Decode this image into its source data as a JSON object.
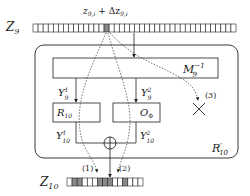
{
  "diagram": {
    "top_register": {
      "label": "Z",
      "label_sub": "9",
      "cell_count": 40,
      "highlighted_cells": [
        14
      ],
      "highlight_label": "z",
      "highlight_label_sub": "9,i",
      "highlight_label_op": " + Δz",
      "highlight_label_sub2": "9,i"
    },
    "outer_box": {
      "label": "R",
      "label_prime": "′",
      "label_sub": "10"
    },
    "mixing_box": {
      "label": "M",
      "label_sub": "9",
      "label_sup": "−1"
    },
    "y9_1": {
      "label": "Y",
      "sub": "9",
      "sup": "1"
    },
    "y9_2": {
      "label": "Y",
      "sub": "9",
      "sup": "2"
    },
    "r10_box": {
      "label": "R",
      "sub": "10"
    },
    "ophi_box": {
      "label": "O",
      "sub": "Φ"
    },
    "y10_1": {
      "label": "Y",
      "sub": "10",
      "sup": "1"
    },
    "y10_2": {
      "label": "Y",
      "sub": "10",
      "sup": "2"
    },
    "xor_symbol": "⊕",
    "path_labels": [
      "(1)",
      "(2)",
      "(3)"
    ],
    "bottom_register": {
      "label": "Z",
      "label_sub": "10",
      "cell_count": 15,
      "highlighted_cells": [
        1,
        2,
        6,
        7,
        8,
        11
      ]
    }
  },
  "colors": {
    "stroke": "#222222",
    "highlight": "#8a8a8a",
    "background": "#ffffff"
  }
}
